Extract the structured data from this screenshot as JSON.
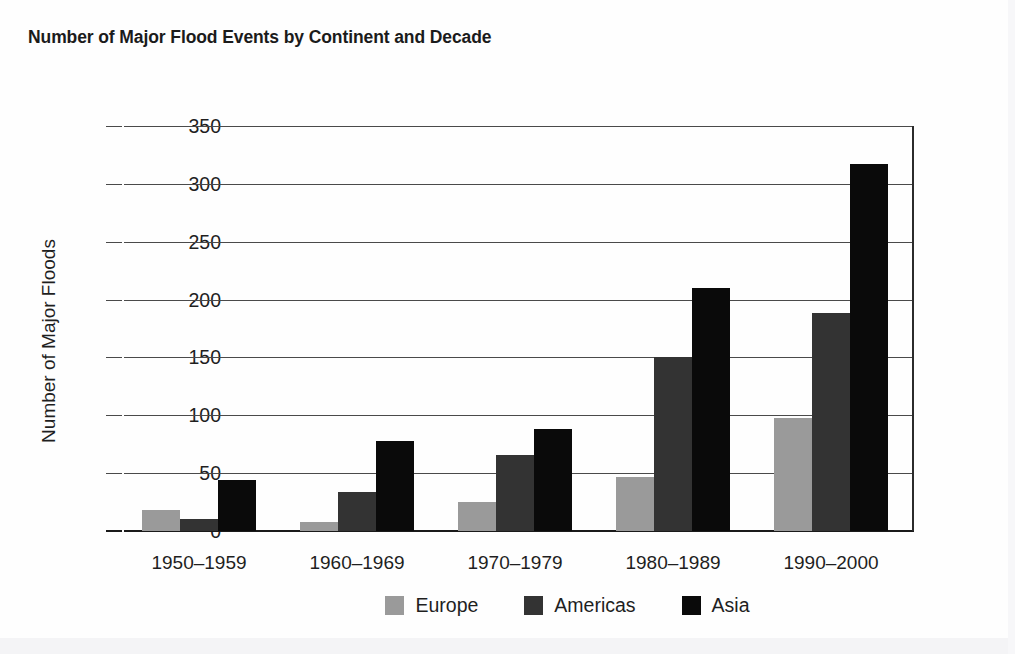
{
  "chart_data": {
    "type": "bar",
    "title": "Number of Major Flood Events by Continent and Decade",
    "xlabel": "",
    "ylabel": "Number of Major Floods",
    "categories": [
      "1950–1959",
      "1960–1969",
      "1970–1979",
      "1980–1989",
      "1990–2000"
    ],
    "series": [
      {
        "name": "Europe",
        "color": "#9a9a9a",
        "values": [
          18,
          8,
          25,
          47,
          98
        ]
      },
      {
        "name": "Americas",
        "color": "#333333",
        "values": [
          10,
          34,
          66,
          150,
          188
        ]
      },
      {
        "name": "Asia",
        "color": "#0a0a0a",
        "values": [
          44,
          78,
          88,
          210,
          317
        ]
      }
    ],
    "ylim": [
      0,
      350
    ],
    "yticks": [
      0,
      50,
      100,
      150,
      200,
      250,
      300,
      350
    ],
    "ytick_labels": [
      "0",
      "50",
      "100",
      "150",
      "200",
      "250",
      "300",
      "350"
    ],
    "grid": true,
    "legend_position": "bottom"
  }
}
